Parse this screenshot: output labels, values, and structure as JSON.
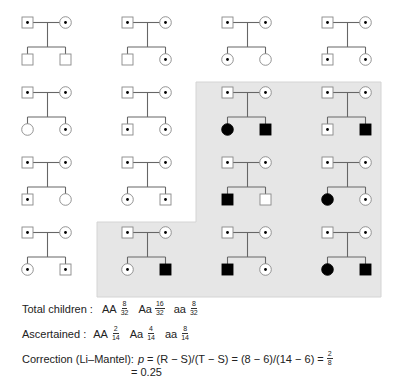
{
  "figure": {
    "colors": {
      "shade": "#e6e6e6",
      "line": "#666666",
      "affected": "#000000",
      "outline": "#888888"
    },
    "legend_symbols": {
      "square": "male",
      "circle": "female",
      "dot": "heterozygous carrier (Aa)",
      "filled": "affected (aa)",
      "empty": "unaffected (AA)"
    },
    "pedigrees": [
      {
        "row": 0,
        "col": 0,
        "shaded": false,
        "father": "carrier",
        "mother": "carrier",
        "children": [
          {
            "sex": "male",
            "status": "normal"
          },
          {
            "sex": "male",
            "status": "normal"
          }
        ]
      },
      {
        "row": 0,
        "col": 1,
        "shaded": false,
        "father": "carrier",
        "mother": "carrier",
        "children": [
          {
            "sex": "male",
            "status": "normal"
          },
          {
            "sex": "female",
            "status": "carrier"
          }
        ]
      },
      {
        "row": 0,
        "col": 2,
        "shaded": false,
        "father": "carrier",
        "mother": "carrier",
        "children": [
          {
            "sex": "female",
            "status": "carrier"
          },
          {
            "sex": "female",
            "status": "normal"
          }
        ]
      },
      {
        "row": 0,
        "col": 3,
        "shaded": false,
        "father": "carrier",
        "mother": "carrier",
        "children": [
          {
            "sex": "male",
            "status": "carrier"
          },
          {
            "sex": "female",
            "status": "carrier"
          }
        ]
      },
      {
        "row": 1,
        "col": 0,
        "shaded": false,
        "father": "carrier",
        "mother": "carrier",
        "children": [
          {
            "sex": "female",
            "status": "normal"
          },
          {
            "sex": "female",
            "status": "carrier"
          }
        ]
      },
      {
        "row": 1,
        "col": 1,
        "shaded": false,
        "father": "carrier",
        "mother": "carrier",
        "children": [
          {
            "sex": "male",
            "status": "carrier"
          },
          {
            "sex": "female",
            "status": "carrier"
          }
        ]
      },
      {
        "row": 1,
        "col": 2,
        "shaded": true,
        "father": "carrier",
        "mother": "carrier",
        "children": [
          {
            "sex": "female",
            "status": "affected"
          },
          {
            "sex": "male",
            "status": "affected"
          }
        ]
      },
      {
        "row": 1,
        "col": 3,
        "shaded": true,
        "father": "carrier",
        "mother": "carrier",
        "children": [
          {
            "sex": "male",
            "status": "carrier"
          },
          {
            "sex": "male",
            "status": "affected"
          }
        ]
      },
      {
        "row": 2,
        "col": 0,
        "shaded": false,
        "father": "carrier",
        "mother": "carrier",
        "children": [
          {
            "sex": "male",
            "status": "carrier"
          },
          {
            "sex": "female",
            "status": "normal"
          }
        ]
      },
      {
        "row": 2,
        "col": 1,
        "shaded": false,
        "father": "carrier",
        "mother": "carrier",
        "children": [
          {
            "sex": "female",
            "status": "carrier"
          },
          {
            "sex": "male",
            "status": "carrier"
          }
        ]
      },
      {
        "row": 2,
        "col": 2,
        "shaded": true,
        "father": "carrier",
        "mother": "carrier",
        "children": [
          {
            "sex": "male",
            "status": "affected"
          },
          {
            "sex": "male",
            "status": "normal"
          }
        ]
      },
      {
        "row": 2,
        "col": 3,
        "shaded": true,
        "father": "carrier",
        "mother": "carrier",
        "children": [
          {
            "sex": "female",
            "status": "affected"
          },
          {
            "sex": "female",
            "status": "carrier"
          }
        ]
      },
      {
        "row": 3,
        "col": 0,
        "shaded": false,
        "father": "carrier",
        "mother": "carrier",
        "children": [
          {
            "sex": "female",
            "status": "carrier"
          },
          {
            "sex": "male",
            "status": "carrier"
          }
        ]
      },
      {
        "row": 3,
        "col": 1,
        "shaded": true,
        "father": "carrier",
        "mother": "carrier",
        "children": [
          {
            "sex": "female",
            "status": "carrier"
          },
          {
            "sex": "male",
            "status": "affected"
          }
        ]
      },
      {
        "row": 3,
        "col": 2,
        "shaded": true,
        "father": "carrier",
        "mother": "carrier",
        "children": [
          {
            "sex": "male",
            "status": "affected"
          },
          {
            "sex": "female",
            "status": "carrier"
          }
        ]
      },
      {
        "row": 3,
        "col": 3,
        "shaded": true,
        "father": "carrier",
        "mother": "carrier",
        "children": [
          {
            "sex": "female",
            "status": "affected"
          },
          {
            "sex": "male",
            "status": "affected"
          }
        ]
      }
    ]
  },
  "totals": {
    "label": "Total children :",
    "items": [
      {
        "genotype": "AA",
        "num": "8",
        "den": "32"
      },
      {
        "genotype": "Aa",
        "num": "16",
        "den": "32"
      },
      {
        "genotype": "aa",
        "num": "8",
        "den": "32"
      }
    ]
  },
  "ascertained": {
    "label": "Ascertained :",
    "items": [
      {
        "genotype": "AA",
        "num": "2",
        "den": "14"
      },
      {
        "genotype": "Aa",
        "num": "4",
        "den": "14"
      },
      {
        "genotype": "aa",
        "num": "8",
        "den": "14"
      }
    ]
  },
  "correction": {
    "label": "Correction (Li–Mantel):",
    "p_symbol": "p",
    "formula": "= (R − S)/(T − S) = (8 − 6)/(14 − 6) =",
    "result_num": "2",
    "result_den": "8",
    "second_line": "= 0.25"
  }
}
